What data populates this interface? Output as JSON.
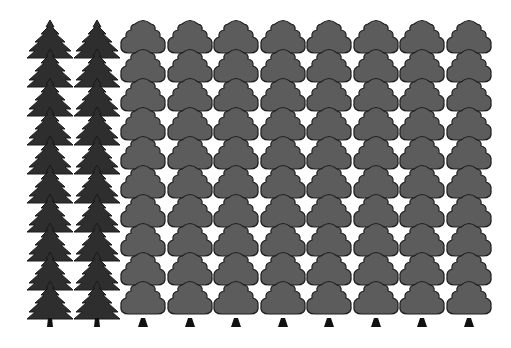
{
  "colors": {
    "background": "#ffffff",
    "conifer_fill": "#2e2e2e",
    "conifer_outline": "#1a1a1a",
    "deciduous_fill": "#5c5c5c",
    "deciduous_outline": "#1e1e1e",
    "trunk": "#111111"
  },
  "groups": [
    {
      "type": "conifer",
      "icon": "conifer-tree-icon",
      "columns": 2,
      "rows": 10,
      "column_centers": [
        50,
        97
      ]
    },
    {
      "type": "deciduous",
      "icon": "deciduous-tree-icon",
      "columns": 8,
      "rows": 10,
      "column_centers": [
        143,
        190,
        236,
        283,
        329,
        376,
        422,
        469
      ]
    }
  ],
  "layout": {
    "top": 20,
    "row_spacing": 29,
    "trunk_bottom": 327
  }
}
